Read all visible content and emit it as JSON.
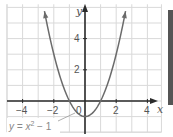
{
  "chart_data": {
    "type": "line",
    "title": "",
    "function": "y = x^2 - 1",
    "series": [
      {
        "name": "y = x² − 1",
        "x": [
          -2.6,
          -2,
          -1.5,
          -1,
          -0.5,
          0,
          0.5,
          1,
          1.5,
          2,
          2.6
        ],
        "y": [
          5.76,
          3,
          1.25,
          0,
          -0.75,
          -1,
          -0.75,
          0,
          1.25,
          3,
          5.76
        ]
      }
    ],
    "xlabel": "x",
    "ylabel": "y",
    "xlim": [
      -5,
      4.9
    ],
    "ylim": [
      -2,
      6.2
    ],
    "x_ticks": [
      "−4",
      "−2",
      "0",
      "2",
      "4"
    ],
    "y_ticks": [
      "2",
      "4"
    ],
    "grid": true,
    "annotation": "y = x² − 1",
    "colors": {
      "curve": "#6b6b6b",
      "axis": "#2b2b2b",
      "grid": "#d9d9d9"
    }
  },
  "labels": {
    "x_axis": "x",
    "y_axis": "y",
    "tick_x_neg4": "−4",
    "tick_x_neg2": "−2",
    "tick_origin": "0",
    "tick_x_2": "2",
    "tick_x_4": "4",
    "tick_y_2": "2",
    "tick_y_4": "4",
    "equation_prefix": "y = x",
    "equation_exp": "2",
    "equation_suffix": " − 1"
  }
}
